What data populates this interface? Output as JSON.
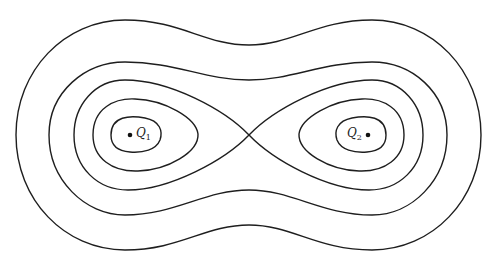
{
  "diagram": {
    "type": "equipotential-contours",
    "colors": {
      "line": "#1e1e1e",
      "background": "#ffffff",
      "dot": "#111111"
    },
    "charges": [
      {
        "id": "Q1",
        "symbol": "Q",
        "subscript": "1",
        "x": 130,
        "y": 135,
        "label_side": "right"
      },
      {
        "id": "Q2",
        "symbol": "Q",
        "subscript": "2",
        "x": 368,
        "y": 135,
        "label_side": "left"
      }
    ],
    "saddle_point": {
      "x": 249,
      "y": 135
    },
    "contours": [
      {
        "id": "inner-oval-q1",
        "d": "M 111 135 C 111 116, 130 115, 145 118 C 160 121, 163 131, 160 140 C 156 150, 143 153, 130 152 C 117 151, 111 145, 111 135 Z"
      },
      {
        "id": "inner-oval-q2",
        "d": "M 386 135 C 386 116, 367 115, 352 118 C 337 121, 334 131, 337 140 C 341 150, 354 153, 367 152 C 380 151, 386 145, 386 135 Z"
      },
      {
        "id": "middle-oval-q1",
        "d": "M 93 135 C 93 108, 115 98, 135 99 C 165 100, 196 118, 198 134 C 199 152, 168 170, 138 171 C 112 172, 93 158, 93 135 Z"
      },
      {
        "id": "middle-oval-q2",
        "d": "M 404 135 C 404 108, 382 98, 362 99 C 332 100, 301 118, 299 134 C 298 152, 329 170, 359 171 C 385 172, 404 158, 404 135 Z"
      },
      {
        "id": "figure-eight",
        "d": "M 249 135 C 225 110, 170 80, 125 80 C 95 80, 74 105, 74 135 C 74 168, 98 190, 128 190 C 170 190, 225 160, 249 135 C 273 110, 328 80, 372 80 C 402 80, 423 105, 423 135 C 423 168, 399 190, 369 190 C 327 190, 273 160, 249 135 Z"
      },
      {
        "id": "peanut-contour",
        "d": "M 49 135 C 49 92, 85 62, 125 62 C 175 62, 205 80, 249 80 C 292 80, 322 62, 372 62 C 412 62, 447 92, 447 135 C 447 180, 412 215, 372 215 C 322 215, 292 190, 249 190 C 205 190, 175 215, 125 215 C 85 215, 49 180, 49 135 Z"
      },
      {
        "id": "outer-contour",
        "d": "M 16 135 C 16 70, 65 20, 125 20 C 180 20, 205 45, 249 45 C 292 45, 317 20, 372 20 C 432 20, 481 70, 481 135 C 481 200, 432 250, 372 250 C 317 250, 292 225, 249 225 C 205 225, 180 250, 125 250 C 65 250, 16 200, 16 135 Z"
      }
    ]
  }
}
